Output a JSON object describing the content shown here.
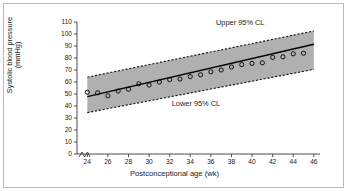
{
  "figure": {
    "border_color": "#b9b9b9",
    "background": "#ffffff"
  },
  "annotations": {
    "upper": "Upper 95% CL",
    "lower": "Lower 95% CL"
  },
  "chart_data": {
    "type": "scatter",
    "title": "",
    "xlabel": "Postconceptional age (wk)",
    "ylabel": "Systolic blood pressure",
    "ylabel_line2": "(mmHg)",
    "xlim": [
      23,
      46.6
    ],
    "ylim": [
      0,
      110
    ],
    "xticks": [
      24,
      26,
      28,
      30,
      32,
      34,
      36,
      38,
      40,
      42,
      44,
      46
    ],
    "yticks": [
      0,
      10,
      20,
      30,
      40,
      50,
      60,
      70,
      80,
      90,
      100,
      110
    ],
    "grid": false,
    "legend": "none",
    "axis_break": true,
    "band_color": "#b0b0b0",
    "line_color": "#000000",
    "marker": "open-circle",
    "series": [
      {
        "name": "Observed systolic blood pressure",
        "x": [
          24,
          25,
          26,
          27,
          28,
          29,
          30,
          31,
          32,
          33,
          34,
          35,
          36,
          37,
          38,
          39,
          40,
          41,
          42,
          43,
          44,
          45
        ],
        "values": [
          51.5,
          51.0,
          48.5,
          52.5,
          54.0,
          58.5,
          57.5,
          60.0,
          62.0,
          62.5,
          64.5,
          66.0,
          68.5,
          70.0,
          72.5,
          74.5,
          75.5,
          76.0,
          80.5,
          81.0,
          83.5,
          84.0
        ]
      },
      {
        "name": "Regression line",
        "x": [
          24,
          46
        ],
        "values": [
          47.8,
          91.5
        ]
      },
      {
        "name": "Upper 95% CL",
        "x": [
          24,
          46
        ],
        "values": [
          64.0,
          102.5
        ]
      },
      {
        "name": "Lower 95% CL",
        "x": [
          24,
          46
        ],
        "values": [
          34.5,
          70.5
        ]
      }
    ]
  }
}
